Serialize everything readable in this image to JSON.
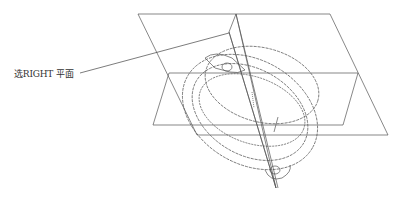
{
  "callout": {
    "label": "选RIGHT 平面"
  },
  "colors": {
    "line": "#555555",
    "text": "#333333",
    "background": "#ffffff"
  }
}
